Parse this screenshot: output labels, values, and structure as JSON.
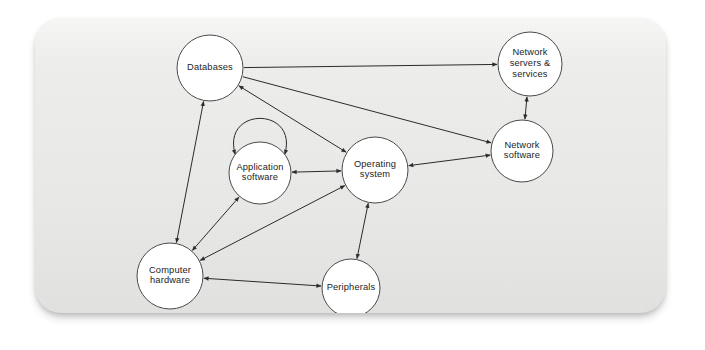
{
  "figure": {
    "kind": "directed-graph-diagram",
    "background_color": "#ffffff",
    "card_color": "#eeeeec",
    "node_fill": "#ffffff",
    "node_stroke": "#4a4a4a",
    "edge_color": "#2b2b2b",
    "label_color": "#1d1d1d"
  },
  "chart_data": {
    "type": "diagram",
    "title": "",
    "nodes": [
      {
        "id": "databases",
        "label": "Databases",
        "label_lines": [
          "Databases"
        ],
        "cx": 175,
        "cy": 50,
        "r": 33
      },
      {
        "id": "network_servers",
        "label": "Network servers & services",
        "label_lines": [
          "Network",
          "servers &",
          "services"
        ],
        "cx": 495,
        "cy": 46,
        "r": 32
      },
      {
        "id": "network_software",
        "label": "Network software",
        "label_lines": [
          "Network",
          "software"
        ],
        "cx": 487,
        "cy": 133,
        "r": 31
      },
      {
        "id": "operating_system",
        "label": "Operating system",
        "label_lines": [
          "Operating",
          "system"
        ],
        "cx": 340,
        "cy": 152,
        "r": 33
      },
      {
        "id": "application_software",
        "label": "Application software",
        "label_lines": [
          "Application",
          "software"
        ],
        "cx": 225,
        "cy": 155,
        "r": 31
      },
      {
        "id": "computer_hardware",
        "label": "Computer hardware",
        "label_lines": [
          "Computer",
          "hardware"
        ],
        "cx": 135,
        "cy": 258,
        "r": 33
      },
      {
        "id": "peripherals",
        "label": "Peripherals",
        "label_lines": [
          "Peripherals"
        ],
        "cx": 316,
        "cy": 270,
        "r": 29
      }
    ],
    "edges": [
      {
        "from": "databases",
        "to": "network_servers",
        "direction": "one-way"
      },
      {
        "from": "databases",
        "to": "network_software",
        "direction": "one-way"
      },
      {
        "from": "databases",
        "to": "operating_system",
        "direction": "two-way"
      },
      {
        "from": "databases",
        "to": "computer_hardware",
        "direction": "two-way"
      },
      {
        "from": "network_software",
        "to": "network_servers",
        "direction": "two-way"
      },
      {
        "from": "network_software",
        "to": "operating_system",
        "direction": "two-way"
      },
      {
        "from": "operating_system",
        "to": "application_software",
        "direction": "two-way"
      },
      {
        "from": "operating_system",
        "to": "computer_hardware",
        "direction": "two-way"
      },
      {
        "from": "operating_system",
        "to": "peripherals",
        "direction": "two-way"
      },
      {
        "from": "application_software",
        "to": "computer_hardware",
        "direction": "two-way"
      },
      {
        "from": "computer_hardware",
        "to": "peripherals",
        "direction": "two-way"
      },
      {
        "from": "application_software",
        "to": "application_software",
        "direction": "self-loop-two-way"
      }
    ]
  }
}
